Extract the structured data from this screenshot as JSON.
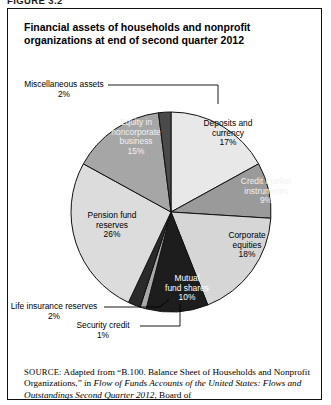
{
  "figure": {
    "tag": "FIGURE 3.2",
    "title": "Financial assets of households and nonprofit organizations at end of second quarter 2012"
  },
  "chart_data": {
    "type": "pie",
    "title": "Financial assets of households and nonprofit organizations at end of second quarter 2012",
    "unit": "percent",
    "legend": "none",
    "labels_inside": true,
    "categories": [
      "Deposits and currency",
      "Credit market instruments",
      "Corporate equities",
      "Mutual fund shares",
      "Security credit",
      "Life insurance reserves",
      "Pension fund reserves",
      "Equity in noncorporate business",
      "Miscellaneous assets"
    ],
    "values": [
      17,
      9,
      18,
      10,
      1,
      2,
      26,
      15,
      2
    ],
    "slices": [
      {
        "name": "Deposits and currency",
        "value": 17,
        "pct_text": "17%",
        "color": "#e8e8e8",
        "text_color": "#000000"
      },
      {
        "name": "Credit market instruments",
        "value": 9,
        "pct_text": "9%",
        "color": "#9a9a9a",
        "text_color": "#f2f2f2"
      },
      {
        "name": "Corporate equities",
        "value": 18,
        "pct_text": "18%",
        "color": "#d6d6d6",
        "text_color": "#000000"
      },
      {
        "name": "Mutual fund shares",
        "value": 10,
        "pct_text": "10%",
        "color": "#1d1d1d",
        "text_color": "#ffffff"
      },
      {
        "name": "Security credit",
        "value": 1,
        "pct_text": "1%",
        "color": "#a8a8a8",
        "text_color": "#000000"
      },
      {
        "name": "Life insurance reserves",
        "value": 2,
        "pct_text": "2%",
        "color": "#2a2a2a",
        "text_color": "#000000"
      },
      {
        "name": "Pension fund reserves",
        "value": 26,
        "pct_text": "26%",
        "color": "#dcdcdc",
        "text_color": "#000000"
      },
      {
        "name": "Equity in noncorporate business",
        "value": 15,
        "pct_text": "15%",
        "color": "#a6a6a6",
        "text_color": "#f2f2f2"
      },
      {
        "name": "Miscellaneous assets",
        "value": 2,
        "pct_text": "2%",
        "color": "#4a4a4a",
        "text_color": "#000000"
      }
    ]
  },
  "labels": {
    "deposits_name_1": "Deposits and",
    "deposits_name_2": "currency",
    "deposits_pct": "17%",
    "credit_name_1": "Credit market",
    "credit_name_2": "instruments",
    "credit_pct": "9%",
    "corporate_name_1": "Corporate",
    "corporate_name_2": "equities",
    "corporate_pct": "18%",
    "mutual_name_1": "Mutual",
    "mutual_name_2": "fund shares",
    "mutual_pct": "10%",
    "pension_name_1": "Pension fund",
    "pension_name_2": "reserves",
    "pension_pct": "26%",
    "equity_name_1": "Equity in",
    "equity_name_2": "noncorporate",
    "equity_name_3": "business",
    "equity_pct": "15%",
    "misc_name": "Miscellaneous assets",
    "misc_pct": "2%",
    "life_name": "Life insurance reserves",
    "life_pct": "2%",
    "security_name": "Security credit",
    "security_pct": "1%"
  },
  "source": {
    "label": "SOURCE:",
    "text_1": " Adapted from “B.100. Balance Sheet of Households and Nonprofit Organizations,” in ",
    "italic_1": "Flow of Funds Accounts of the United States: Flows and Outstandings Second Quarter 2012",
    "text_2": ", Board of"
  }
}
